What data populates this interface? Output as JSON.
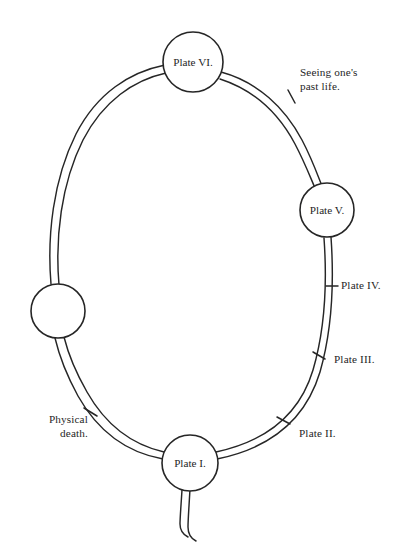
{
  "figure": {
    "kind": "ring-cycle-diagram",
    "background_color": "#ffffff",
    "ink_color": "#262626",
    "nodes": [
      {
        "id": "plate-vi",
        "label": "Plate VI.",
        "position": "top",
        "cx": 193,
        "cy": 62,
        "r": 30,
        "labeled": true
      },
      {
        "id": "plate-v",
        "label": "Plate V.",
        "position": "right",
        "cx": 327,
        "cy": 210,
        "r": 27,
        "labeled": true
      },
      {
        "id": "plate-i",
        "label": "Plate I.",
        "position": "bottom",
        "cx": 190,
        "cy": 463,
        "r": 28,
        "labeled": true
      },
      {
        "id": "unlabeled-node",
        "label": "",
        "position": "left",
        "cx": 58,
        "cy": 311,
        "r": 27,
        "labeled": false
      }
    ],
    "annotations": [
      {
        "id": "seeing-past-life",
        "text": "Seeing one's\npast life.",
        "align": "left",
        "x": 300,
        "y": 66
      },
      {
        "id": "plate-iv",
        "text": "Plate IV.",
        "align": "left",
        "x": 341,
        "y": 284
      },
      {
        "id": "plate-iii",
        "text": "Plate III.",
        "align": "left",
        "x": 334,
        "y": 358
      },
      {
        "id": "plate-ii",
        "text": "Plate II.",
        "align": "left",
        "x": 299,
        "y": 432
      },
      {
        "id": "physical-death",
        "text": "Physical\ndeath.",
        "align": "right",
        "x": 16,
        "y": 417
      }
    ]
  }
}
